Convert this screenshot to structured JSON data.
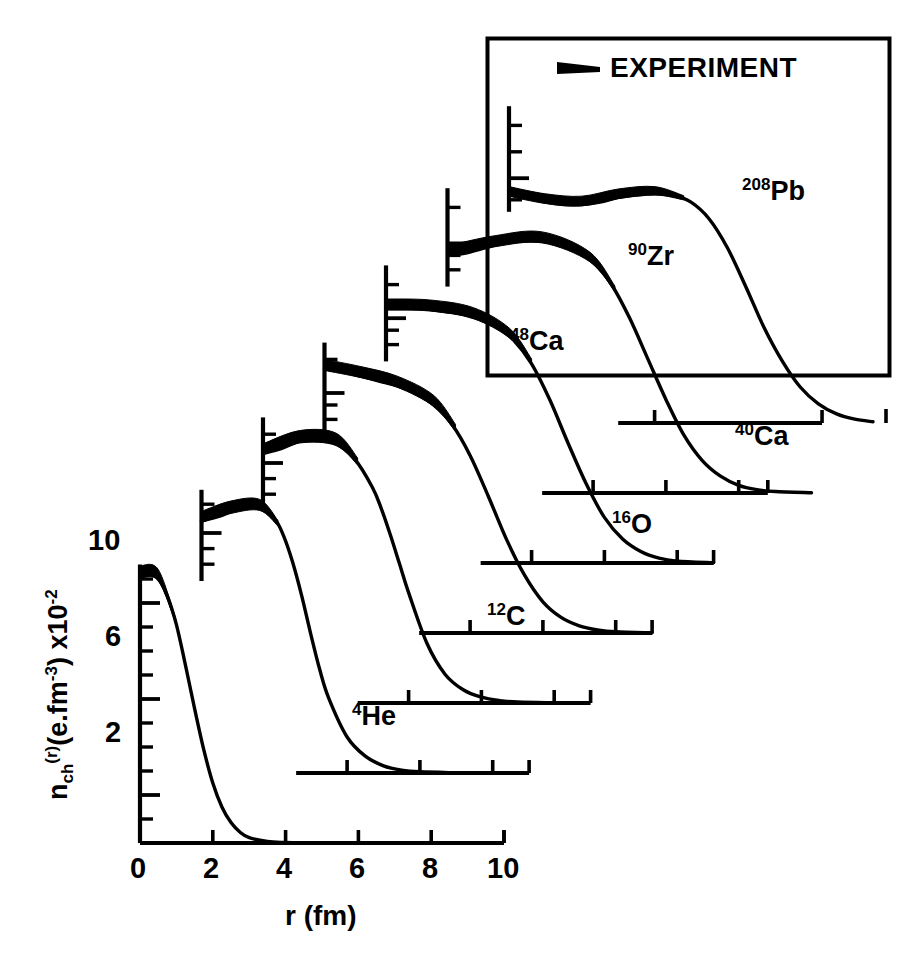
{
  "figure": {
    "domain": "chart",
    "background": "#ffffff",
    "ink": "#000000"
  },
  "axes": {
    "x_title": "r (fm)",
    "x_ticklabels": [
      "0",
      "2",
      "4",
      "6",
      "8",
      "10"
    ],
    "x_tickvalues": [
      0,
      2,
      4,
      6,
      8,
      10
    ],
    "y_ticklabels": [
      "2",
      "6",
      "10"
    ],
    "y_tickvalues": [
      2,
      6,
      10
    ],
    "y_title_main": "n",
    "y_title_sub": "ch",
    "y_title_sup": "(r)",
    "y_title_units": "(e.fm",
    "y_title_units_exp": "-3",
    "y_title_tail": ") x10",
    "y_title_tail_exp": "-2"
  },
  "legend": {
    "label": "EXPERIMENT",
    "marker": "tapered-black-band"
  },
  "curves": [
    {
      "name": "He-4",
      "label_mass": "4",
      "label_sym": "He",
      "label_x": 352,
      "label_y": 700
    },
    {
      "name": "C-12",
      "label_mass": "12",
      "label_sym": "C",
      "label_x": 487,
      "label_y": 600
    },
    {
      "name": "O-16",
      "label_mass": "16",
      "label_sym": "O",
      "label_x": 612,
      "label_y": 508
    },
    {
      "name": "Ca-40",
      "label_mass": "40",
      "label_sym": "Ca",
      "label_x": 735,
      "label_y": 420
    },
    {
      "name": "Ca-48",
      "label_mass": "48",
      "label_sym": "Ca",
      "label_x": 510,
      "label_y": 325
    },
    {
      "name": "Zr-90",
      "label_mass": "90",
      "label_sym": "Zr",
      "label_x": 628,
      "label_y": 240
    },
    {
      "name": "Pb-208",
      "label_mass": "208",
      "label_sym": "Pb",
      "label_x": 742,
      "label_y": 175
    }
  ],
  "chart_data": {
    "type": "line",
    "title": "",
    "xlabel": "r (fm)",
    "ylabel": "n_ch(r) (e.fm^-3) x10^-2",
    "xlim": [
      0,
      10
    ],
    "ylim": [
      0,
      12
    ],
    "grid": false,
    "legend_position": "top-right-box",
    "legend_entries": [
      "EXPERIMENT"
    ],
    "note": "Charge density distributions of seven nuclei, each curve drawn on its own offset baseline (staggered cascade). Values are charge density in e.fm^-3 x10^-2 versus radius r in fm. Thick black bands indicate the experimental uncertainty envelope near the central/peak region.",
    "xticks": [
      0,
      2,
      4,
      6,
      8,
      10
    ],
    "yticks": [
      2,
      6,
      10
    ],
    "series": [
      {
        "name": "4He",
        "x": [
          0.0,
          0.25,
          0.5,
          0.75,
          1.0,
          1.25,
          1.5,
          1.75,
          2.0,
          2.25,
          2.5,
          2.75,
          3.0,
          3.5,
          4.0,
          4.5,
          5.0
        ],
        "values": [
          11.1,
          11.2,
          11.0,
          10.3,
          9.1,
          7.4,
          5.6,
          3.9,
          2.5,
          1.5,
          0.85,
          0.45,
          0.22,
          0.06,
          0.02,
          0.005,
          0.0
        ],
        "band_x": [
          0.0,
          0.5,
          1.0
        ],
        "band_halfwidth": [
          0.45,
          0.4,
          0.15
        ]
      },
      {
        "name": "12C",
        "x": [
          0.0,
          0.5,
          1.0,
          1.5,
          2.0,
          2.25,
          2.5,
          2.75,
          3.0,
          3.25,
          3.5,
          4.0,
          4.5,
          5.0,
          5.5,
          6.0,
          7.0
        ],
        "values": [
          10.5,
          10.7,
          11.0,
          11.1,
          10.6,
          9.9,
          8.8,
          7.4,
          5.8,
          4.3,
          3.1,
          1.5,
          0.7,
          0.3,
          0.12,
          0.05,
          0.01
        ],
        "band_x": [
          0.0,
          0.8,
          1.6,
          2.1
        ],
        "band_halfwidth": [
          0.4,
          0.45,
          0.4,
          0.2
        ]
      },
      {
        "name": "16O",
        "x": [
          0.0,
          0.5,
          1.0,
          1.5,
          2.0,
          2.5,
          3.0,
          3.25,
          3.5,
          3.75,
          4.0,
          4.5,
          5.0,
          5.5,
          6.0,
          6.5,
          7.0,
          8.0
        ],
        "values": [
          10.4,
          10.6,
          10.9,
          11.0,
          10.8,
          10.2,
          9.0,
          8.1,
          7.0,
          5.8,
          4.6,
          2.5,
          1.2,
          0.55,
          0.24,
          0.1,
          0.04,
          0.01
        ],
        "band_x": [
          0.0,
          1.0,
          2.0,
          2.6
        ],
        "band_halfwidth": [
          0.4,
          0.45,
          0.45,
          0.25
        ]
      },
      {
        "name": "40Ca",
        "x": [
          0.0,
          0.5,
          1.0,
          1.5,
          2.0,
          2.5,
          3.0,
          3.5,
          4.0,
          4.5,
          5.0,
          5.5,
          6.0,
          6.5,
          7.0,
          7.5,
          8.0,
          9.0
        ],
        "values": [
          11.0,
          10.9,
          10.7,
          10.5,
          10.3,
          10.0,
          9.5,
          8.7,
          7.4,
          5.7,
          3.9,
          2.4,
          1.3,
          0.65,
          0.3,
          0.13,
          0.05,
          0.01
        ],
        "band_x": [
          0.0,
          1.0,
          2.0,
          3.0,
          3.6
        ],
        "band_halfwidth": [
          0.4,
          0.4,
          0.4,
          0.4,
          0.25
        ]
      },
      {
        "name": "48Ca",
        "x": [
          0.0,
          0.5,
          1.0,
          1.5,
          2.0,
          2.5,
          3.0,
          3.5,
          4.0,
          4.5,
          5.0,
          5.5,
          6.0,
          6.5,
          7.0,
          7.5,
          8.0,
          9.0
        ],
        "values": [
          10.6,
          10.6,
          10.6,
          10.5,
          10.4,
          10.2,
          9.9,
          9.3,
          8.3,
          6.8,
          5.0,
          3.3,
          1.9,
          1.0,
          0.48,
          0.2,
          0.08,
          0.015
        ],
        "band_x": [
          0.0,
          1.2,
          2.4,
          3.4,
          4.0
        ],
        "band_halfwidth": [
          0.4,
          0.4,
          0.4,
          0.35,
          0.2
        ]
      },
      {
        "name": "90Zr",
        "x": [
          0.0,
          0.5,
          1.0,
          1.5,
          2.0,
          2.5,
          3.0,
          3.5,
          4.0,
          4.5,
          5.0,
          5.5,
          6.0,
          6.5,
          7.0,
          7.5,
          8.0,
          8.5,
          9.0,
          10.0
        ],
        "values": [
          9.9,
          10.0,
          10.2,
          10.4,
          10.5,
          10.5,
          10.4,
          10.1,
          9.6,
          8.7,
          7.3,
          5.6,
          3.9,
          2.4,
          1.35,
          0.7,
          0.32,
          0.14,
          0.06,
          0.01
        ],
        "band_x": [
          0.0,
          1.3,
          2.6,
          3.9,
          4.6
        ],
        "band_halfwidth": [
          0.4,
          0.4,
          0.4,
          0.35,
          0.2
        ]
      },
      {
        "name": "208Pb",
        "x": [
          0.0,
          0.5,
          1.0,
          1.5,
          2.0,
          2.5,
          3.0,
          3.5,
          4.0,
          4.5,
          5.0,
          5.5,
          6.0,
          6.5,
          7.0,
          7.5,
          8.0,
          8.5,
          9.0,
          9.5,
          10.0
        ],
        "values": [
          9.5,
          9.4,
          9.2,
          9.1,
          9.1,
          9.2,
          9.4,
          9.5,
          9.55,
          9.5,
          9.2,
          8.5,
          7.3,
          5.7,
          4.0,
          2.6,
          1.5,
          0.8,
          0.38,
          0.16,
          0.05
        ],
        "band_x": [
          0.0,
          1.0,
          2.0,
          3.0,
          4.0,
          4.8
        ],
        "band_halfwidth": [
          0.35,
          0.35,
          0.35,
          0.35,
          0.3,
          0.15
        ]
      }
    ]
  }
}
